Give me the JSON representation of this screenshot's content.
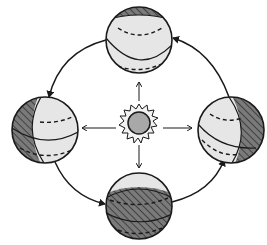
{
  "diagram": {
    "colors": {
      "background": "#ffffff",
      "stroke": "#1a1a1a",
      "globe_fill": "#e6e6e6",
      "shadow_fill": "#7a7a7a",
      "sun_core": "#a8a8a8",
      "sun_halo": "#f2f2f2"
    },
    "sun": {
      "cx": 139,
      "cy": 123,
      "r": 10
    },
    "globes": [
      {
        "id": "top",
        "cx": 139,
        "cy": 40,
        "r": 33,
        "shadow_side": "top"
      },
      {
        "id": "left",
        "cx": 45,
        "cy": 130,
        "r": 33,
        "shadow_side": "left"
      },
      {
        "id": "right",
        "cx": 231,
        "cy": 130,
        "r": 33,
        "shadow_side": "right"
      },
      {
        "id": "bottom",
        "cx": 139,
        "cy": 206,
        "r": 33,
        "shadow_side": "bottom"
      }
    ],
    "orbit_direction": [
      "top",
      "left",
      "bottom",
      "right",
      "top"
    ],
    "rays": [
      "up",
      "down",
      "left",
      "right"
    ]
  }
}
